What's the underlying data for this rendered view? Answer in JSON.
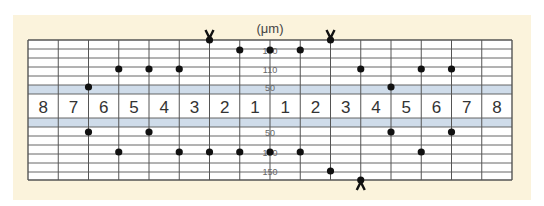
{
  "chart_data": {
    "type": "scatter",
    "title": "",
    "unit_label": "(μm)",
    "columns": [
      "8",
      "7",
      "6",
      "5",
      "4",
      "3",
      "2",
      "1",
      "1",
      "2",
      "3",
      "4",
      "5",
      "6",
      "7",
      "8"
    ],
    "upper_scale_labels": [
      "100",
      "110",
      "50"
    ],
    "lower_scale_labels": [
      "50",
      "100",
      "150"
    ],
    "colors": {
      "background_panel": "#fbf3dc",
      "band": "#cfdcea",
      "grid": "#555555",
      "dot": "#111111"
    },
    "upper_points": [
      {
        "col": 2,
        "level": "50"
      },
      {
        "col": 3,
        "level": "110"
      },
      {
        "col": 4,
        "level": "110"
      },
      {
        "col": 5,
        "level": "110"
      },
      {
        "col": 6,
        "level": "top",
        "marker": "V"
      },
      {
        "col": 7,
        "level": "100"
      },
      {
        "col": 8,
        "level": "100"
      },
      {
        "col": 9,
        "level": "100"
      },
      {
        "col": 10,
        "level": "top",
        "marker": "V"
      },
      {
        "col": 11,
        "level": "110"
      },
      {
        "col": 12,
        "level": "50"
      },
      {
        "col": 13,
        "level": "110"
      },
      {
        "col": 14,
        "level": "110"
      }
    ],
    "lower_points": [
      {
        "col": 2,
        "level": "50"
      },
      {
        "col": 3,
        "level": "100"
      },
      {
        "col": 4,
        "level": "50"
      },
      {
        "col": 5,
        "level": "100"
      },
      {
        "col": 6,
        "level": "100"
      },
      {
        "col": 7,
        "level": "100"
      },
      {
        "col": 8,
        "level": "100"
      },
      {
        "col": 9,
        "level": "100"
      },
      {
        "col": 10,
        "level": "150"
      },
      {
        "col": 11,
        "level": "bottom",
        "marker": "Λ"
      },
      {
        "col": 12,
        "level": "50"
      },
      {
        "col": 13,
        "level": "100"
      },
      {
        "col": 14,
        "level": "50"
      }
    ],
    "grid": true
  }
}
